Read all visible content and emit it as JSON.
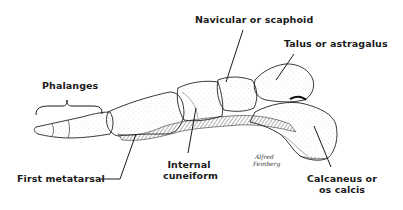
{
  "figure": {
    "labels": {
      "navicular": "Navicular or scaphoid",
      "talus": "Talus or astragalus",
      "phalanges": "Phalanges",
      "first_metatarsal": "First metatarsal",
      "internal_cuneiform_line1": "Internal",
      "internal_cuneiform_line2": "cuneiform",
      "calcaneus_line1": "Calcaneus or",
      "calcaneus_line2": "os calcis"
    },
    "signature": {
      "line1": "Alfred",
      "line2": "Feinberg"
    },
    "colors": {
      "ink": "#1a1a1a",
      "background": "#ffffff",
      "hatch": "#555555"
    }
  }
}
